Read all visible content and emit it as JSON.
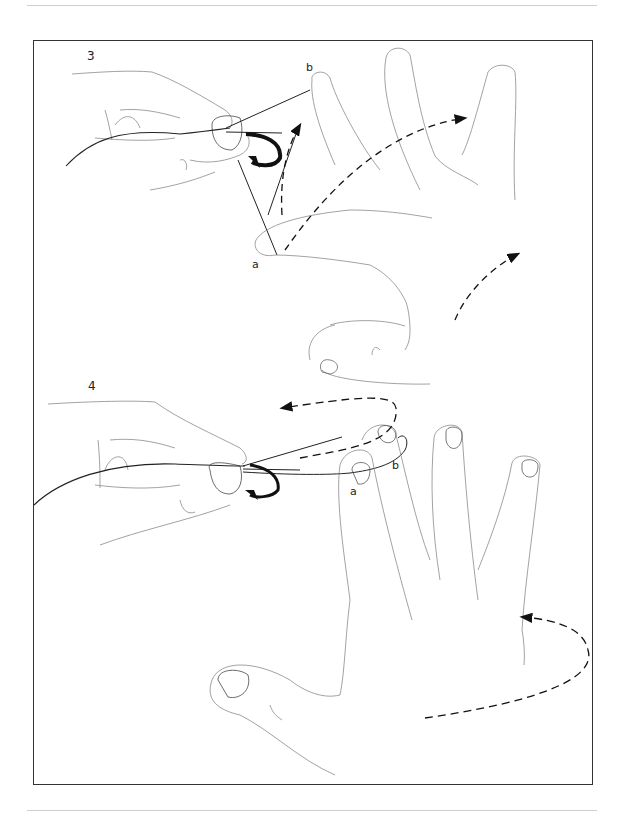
{
  "page": {
    "type": "illustration-page",
    "header_rule": true,
    "footer_rule": true
  },
  "figure": {
    "steps": [
      {
        "number": "3",
        "labels": {
          "a": "a",
          "b": "b"
        },
        "arrows": [
          "curved-arrow-hook-rotation",
          "dashed-arrow-up-to-b",
          "dashed-arrow-right-across-fingers",
          "dashed-arrow-up-right"
        ]
      },
      {
        "number": "4",
        "labels": {
          "a": "a",
          "b": "b"
        },
        "arrows": [
          "dashed-loop-arrow-left",
          "dashed-loop-arrow-back-to-hand"
        ]
      }
    ]
  },
  "colors": {
    "line": "#222222",
    "sketch": "#8a8a8a",
    "frame": "#333333",
    "rule": "#cfcfcf"
  }
}
